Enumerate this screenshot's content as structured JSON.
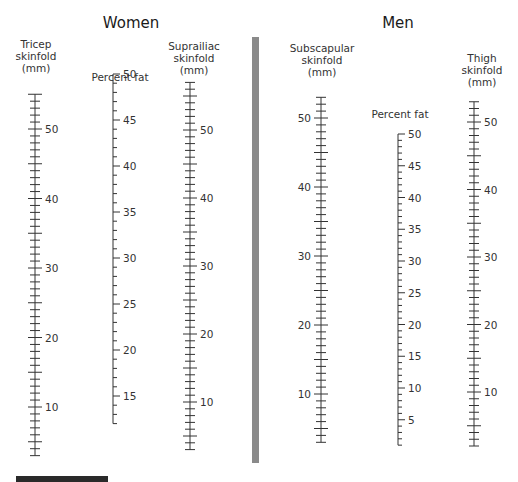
{
  "women": {
    "title": "Women",
    "tricep_label": [
      "Tricep",
      "skinfold",
      "(mm)"
    ],
    "percent_fat_label": "Percent fat",
    "suprailiac_label": [
      "Suprailiac",
      "skinfold",
      "(mm)"
    ]
  },
  "men": {
    "title": "Men",
    "subscapular_label": [
      "Subscapular",
      "skinfold",
      "(mm)"
    ],
    "percent_fat_label": "Percent fat",
    "thigh_label": [
      "Thigh",
      "skinfold",
      "(mm)"
    ]
  },
  "colors": {
    "ink": "#333333",
    "divider": "#8a8a8a",
    "footer_bar": "#2a2a2a"
  },
  "chart_data": {
    "type": "nomogram",
    "panels": [
      {
        "name": "Women",
        "scales": [
          {
            "name": "Tricep skinfold (mm)",
            "x": 35,
            "min": 3,
            "max": 55,
            "y_at_min": 458,
            "px_per_unit": 6.95,
            "y_ref_value": 50,
            "y_ref": 129,
            "labels": [
              10,
              20,
              30,
              40,
              50
            ],
            "minor_step": 1,
            "major_step": 5,
            "tick_side": "both",
            "label_side": "right"
          },
          {
            "name": "Percent fat",
            "x": 113,
            "min": 12,
            "max": 50,
            "px_per_unit": 9.2,
            "y_ref_value": 50,
            "y_ref": 74,
            "labels": [
              15,
              20,
              25,
              30,
              35,
              40,
              45,
              50
            ],
            "minor_step": 1,
            "major_step": 5,
            "tick_side": "right",
            "label_side": "right"
          },
          {
            "name": "Suprailiac skinfold (mm)",
            "x": 190,
            "min": 3,
            "max": 57,
            "px_per_unit": 6.8,
            "y_ref_value": 50,
            "y_ref": 130,
            "labels": [
              10,
              20,
              30,
              40,
              50
            ],
            "minor_step": 1,
            "major_step": 5,
            "tick_side": "both",
            "label_side": "right"
          }
        ]
      },
      {
        "name": "Men",
        "scales": [
          {
            "name": "Subscapular skinfold (mm)",
            "x": 321,
            "min": 3,
            "max": 53,
            "px_per_unit": 6.9,
            "y_ref_value": 50,
            "y_ref": 118,
            "labels": [
              10,
              20,
              30,
              40,
              50
            ],
            "minor_step": 1,
            "major_step": 5,
            "tick_side": "both",
            "label_side": "left"
          },
          {
            "name": "Percent fat",
            "x": 398,
            "min": 1,
            "max": 50,
            "px_per_unit": 6.35,
            "y_ref_value": 50,
            "y_ref": 134,
            "labels": [
              5,
              10,
              15,
              20,
              25,
              30,
              35,
              40,
              45,
              50
            ],
            "minor_step": 1,
            "major_step": 5,
            "tick_side": "right",
            "label_side": "right"
          },
          {
            "name": "Thigh skinfold (mm)",
            "x": 474,
            "min": 2,
            "max": 53,
            "px_per_unit": 6.75,
            "y_ref_value": 50,
            "y_ref": 122,
            "labels": [
              10,
              20,
              30,
              40,
              50
            ],
            "minor_step": 1,
            "major_step": 5,
            "tick_side": "both",
            "label_side": "right"
          }
        ]
      }
    ]
  }
}
